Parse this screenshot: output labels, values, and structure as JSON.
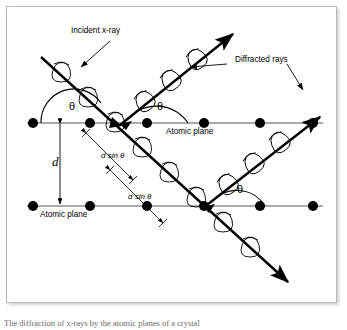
{
  "figure": {
    "background_color": "#ffffff",
    "line_color": "#000000",
    "frame_color": "#b9b9b9",
    "caption": "The diffraction of x-rays by the atomic planes of a crystal"
  },
  "labels": {
    "incident_ray": "Incident x-ray",
    "diffracted_rays": "Diffracted rays",
    "atomic_plane_top": "Atomic plane",
    "atomic_plane_bottom": "Atomic plane",
    "spacing": "d",
    "path_difference_upper": "d sin θ",
    "path_difference_lower": "d sin θ",
    "theta_1": "θ",
    "theta_2": "θ",
    "theta_3": "θ"
  },
  "geometry": {
    "planes": [
      {
        "name": "upper-atomic-plane",
        "y": 123,
        "x_start": 27,
        "x_end": 323,
        "atoms_x": [
          33,
          90,
          147,
          204,
          260,
          313
        ]
      },
      {
        "name": "lower-atomic-plane",
        "y": 206,
        "x_start": 27,
        "x_end": 323,
        "atoms_x": [
          33,
          90,
          147,
          204,
          260,
          313
        ]
      }
    ],
    "atom_radius": 5,
    "interplanar_spacing_px": 83,
    "incident_angle_deg": 40
  },
  "rays": [
    {
      "name": "incident-x-ray",
      "kind": "incident",
      "from": [
        41,
        57
      ],
      "to": [
        290,
        284
      ],
      "wave": true
    },
    {
      "name": "diffracted-ray-upper",
      "kind": "diffracted",
      "from": [
        122,
        123
      ],
      "to": [
        232,
        35
      ],
      "wave": true
    },
    {
      "name": "diffracted-ray-lower",
      "kind": "diffracted",
      "from": [
        205,
        206
      ],
      "to": [
        318,
        118
      ],
      "wave": true
    }
  ],
  "annotations": {
    "spacing_arrow": {
      "x": 60,
      "y_top": 124,
      "y_bottom": 205
    },
    "leader_incident": {
      "from": [
        108,
        42
      ],
      "to": [
        82,
        66
      ]
    },
    "leader_diffracted_left": {
      "from": [
        225,
        63
      ],
      "to": [
        193,
        66
      ]
    },
    "leader_diffracted_right": {
      "from": [
        287,
        63
      ],
      "to": [
        302,
        88
      ]
    }
  }
}
